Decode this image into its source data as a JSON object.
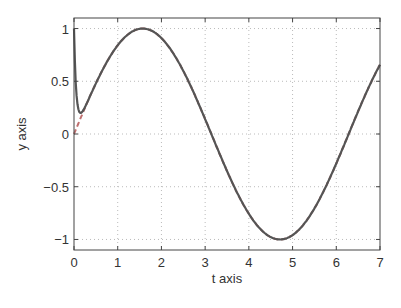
{
  "chart_data": {
    "type": "line",
    "title": "",
    "xlabel": "t axis",
    "ylabel": "y axis",
    "xlim": [
      0,
      7
    ],
    "ylim": [
      -1.1,
      1.1
    ],
    "xticks": [
      0,
      1,
      2,
      3,
      4,
      5,
      6,
      7
    ],
    "yticks": [
      -1,
      -0.5,
      0,
      0.5,
      1
    ],
    "xtick_labels": [
      "0",
      "1",
      "2",
      "3",
      "4",
      "5",
      "6",
      "7"
    ],
    "ytick_labels": [
      "−1",
      "−0.5",
      "0",
      "0.5",
      "1"
    ],
    "grid": true,
    "legend": null,
    "series": [
      {
        "name": "solution (solid)",
        "style": "solid",
        "color": "#555555",
        "description": "starts at 1, dips to ~0.3 near t=0.15, then follows sin(t)",
        "x": [
          0,
          0.05,
          0.1,
          0.15,
          0.2,
          0.3,
          0.5,
          1.0,
          1.57,
          2.0,
          3.0,
          3.14,
          4.0,
          4.71,
          5.0,
          6.0,
          6.28,
          7.0
        ],
        "y": [
          1.0,
          0.55,
          0.35,
          0.3,
          0.31,
          0.35,
          0.48,
          0.84,
          1.0,
          0.91,
          0.14,
          0.0,
          -0.76,
          -1.0,
          -0.96,
          -0.28,
          0.0,
          0.66
        ]
      },
      {
        "name": "sin(t) (dashed)",
        "style": "dashed",
        "color": "#c07070",
        "description": "starts at 0 and follows sin(t)",
        "x": [
          0,
          0.1,
          0.2,
          0.3,
          0.5,
          1.0,
          1.57,
          2.0,
          3.0,
          3.14,
          4.0,
          4.71,
          5.0,
          6.0,
          6.28,
          7.0
        ],
        "y": [
          0.0,
          0.1,
          0.2,
          0.3,
          0.48,
          0.84,
          1.0,
          0.91,
          0.14,
          0.0,
          -0.76,
          -1.0,
          -0.96,
          -0.28,
          0.0,
          0.66
        ]
      }
    ]
  }
}
